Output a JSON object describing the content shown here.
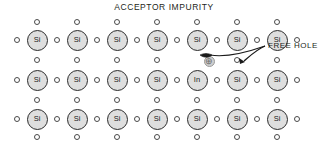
{
  "figure": {
    "title": "ACCEPTOR IMPURITY",
    "annotation_label": "FREE HOLE",
    "hole_symbol": "⊕",
    "colors": {
      "atom_fill": "#dedede",
      "atom_stroke": "#2b2b2b",
      "electron_fill": "#ffffff",
      "electron_stroke": "#4a4a4a",
      "hole_fill": "#cfcfcf",
      "hole_stroke": "#9a9a9a",
      "text": "#231f20",
      "background": "#ffffff"
    }
  },
  "lattice": {
    "rows": 3,
    "cols": 7,
    "col_x": [
      37,
      77,
      117,
      157,
      197,
      237,
      277
    ],
    "row_y": [
      40,
      80,
      119
    ],
    "atoms": [
      {
        "row": 0,
        "col": 0,
        "symbol": "Si",
        "name": "silicon"
      },
      {
        "row": 0,
        "col": 1,
        "symbol": "Si",
        "name": "silicon"
      },
      {
        "row": 0,
        "col": 2,
        "symbol": "Si",
        "name": "silicon"
      },
      {
        "row": 0,
        "col": 3,
        "symbol": "Si",
        "name": "silicon"
      },
      {
        "row": 0,
        "col": 4,
        "symbol": "Si",
        "name": "silicon"
      },
      {
        "row": 0,
        "col": 5,
        "symbol": "Si",
        "name": "silicon"
      },
      {
        "row": 0,
        "col": 6,
        "symbol": "Si",
        "name": "silicon"
      },
      {
        "row": 1,
        "col": 0,
        "symbol": "Si",
        "name": "silicon"
      },
      {
        "row": 1,
        "col": 1,
        "symbol": "Si",
        "name": "silicon"
      },
      {
        "row": 1,
        "col": 2,
        "symbol": "Si",
        "name": "silicon"
      },
      {
        "row": 1,
        "col": 3,
        "symbol": "Si",
        "name": "silicon"
      },
      {
        "row": 1,
        "col": 4,
        "symbol": "In",
        "name": "indium-acceptor"
      },
      {
        "row": 1,
        "col": 5,
        "symbol": "Si",
        "name": "silicon"
      },
      {
        "row": 1,
        "col": 6,
        "symbol": "Si",
        "name": "silicon"
      },
      {
        "row": 2,
        "col": 0,
        "symbol": "Si",
        "name": "silicon"
      },
      {
        "row": 2,
        "col": 1,
        "symbol": "Si",
        "name": "silicon"
      },
      {
        "row": 2,
        "col": 2,
        "symbol": "Si",
        "name": "silicon"
      },
      {
        "row": 2,
        "col": 3,
        "symbol": "Si",
        "name": "silicon"
      },
      {
        "row": 2,
        "col": 4,
        "symbol": "Si",
        "name": "silicon"
      },
      {
        "row": 2,
        "col": 5,
        "symbol": "Si",
        "name": "silicon"
      },
      {
        "row": 2,
        "col": 6,
        "symbol": "Si",
        "name": "silicon"
      }
    ],
    "electrons_horizontal": {
      "note": "between-column bond electrons, per row",
      "x": [
        17,
        57,
        97,
        137,
        177,
        217,
        257
      ],
      "y": [
        40,
        80,
        119
      ]
    },
    "electrons_vertical": {
      "note": "above and below each atom column",
      "x": [
        37,
        77,
        117,
        157,
        197,
        237,
        277
      ],
      "y": [
        22,
        60,
        100,
        137
      ]
    },
    "missing_electron": {
      "x": 197,
      "y": 60,
      "reason": "vacancy-replaced-by-hole"
    },
    "hole": {
      "x": 209,
      "y": 61
    }
  },
  "annotation": {
    "label_x": 268,
    "label_y": 41
  }
}
